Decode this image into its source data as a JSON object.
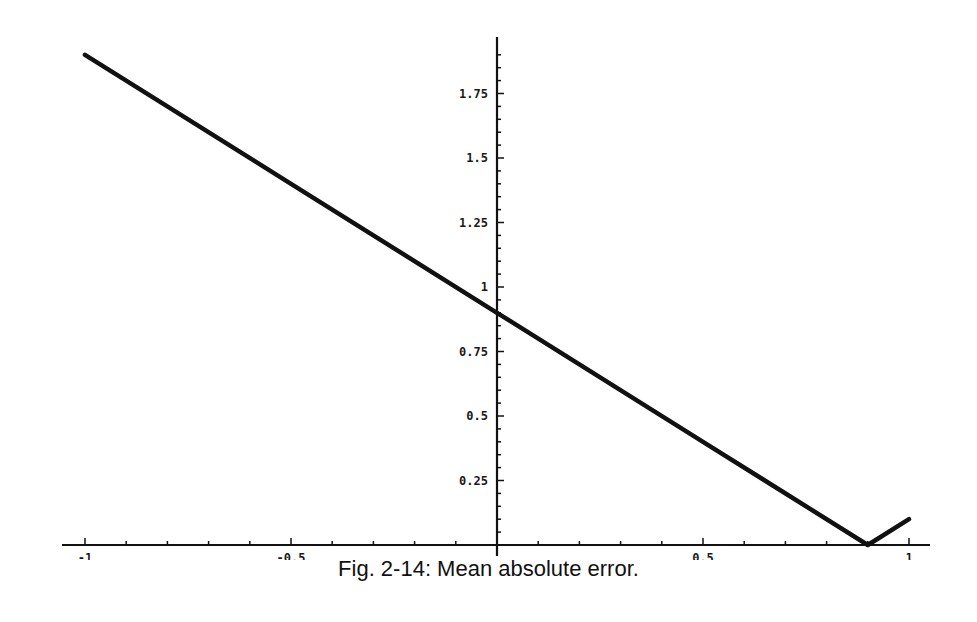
{
  "caption": "Fig. 2-14: Mean absolute error.",
  "chart_data": {
    "type": "line",
    "title": "Fig. 2-14: Mean absolute error.",
    "xlabel": "",
    "ylabel": "",
    "xlim": [
      -1,
      1
    ],
    "ylim": [
      0,
      1.9
    ],
    "grid": false,
    "legend": null,
    "x_ticks": [
      -1,
      -0.5,
      0.5,
      1
    ],
    "x_tick_labels": [
      "-1",
      "-0.5",
      "0.5",
      "1"
    ],
    "y_ticks": [
      0.25,
      0.5,
      0.75,
      1,
      1.25,
      1.5,
      1.75
    ],
    "y_tick_labels": [
      "0.25",
      "0.5",
      "0.75",
      "1",
      "1.25",
      "1.5",
      "1.75"
    ],
    "series": [
      {
        "name": "mean absolute error",
        "x": [
          -1,
          -0.5,
          0,
          0.5,
          0.9,
          1
        ],
        "y": [
          1.9,
          1.4,
          0.9,
          0.4,
          0.0,
          0.1
        ]
      }
    ],
    "annotations": []
  },
  "style": {
    "line_color": "#111111",
    "axis_color": "#111111",
    "background": "#ffffff"
  }
}
